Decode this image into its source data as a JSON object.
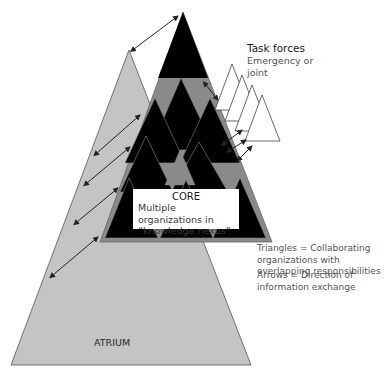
{
  "diagram": {
    "colors": {
      "atrium_fill": "#c4c4c4",
      "core_band": "#8a8a8a",
      "organization_fill": "#000000",
      "task_force_fill": "#ffffff",
      "arrow": "#222222"
    },
    "task_forces": {
      "title": "Task forces",
      "subtitle": "Emergency or joint"
    },
    "core": {
      "title": "CORE",
      "subtitle": "Multiple organizations in “knowledge nexus”"
    },
    "legend": {
      "triangles": "Triangles = Collaborating organizations with overlapping responsibilities",
      "arrows": "Arrows = Direction of information exchange"
    },
    "atrium": {
      "label": "ATRIUM"
    }
  }
}
